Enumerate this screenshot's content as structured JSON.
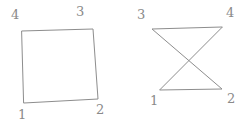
{
  "canvas": {
    "width": 248,
    "height": 126,
    "background": "#ffffff",
    "stroke_color": "#8d8d8d",
    "label_color": "#8a8a8a",
    "stroke_width": 1
  },
  "figures": [
    {
      "id": "simple-quadrilateral",
      "name": "left-figure",
      "kind": "simple convex quadrilateral",
      "vertices": [
        {
          "label": "1",
          "x": 24,
          "y": 103,
          "label_x": 18,
          "label_y": 108
        },
        {
          "label": "2",
          "x": 98,
          "y": 99,
          "label_x": 96,
          "label_y": 103
        },
        {
          "label": "3",
          "x": 93,
          "y": 29,
          "label_x": 76,
          "label_y": 5
        },
        {
          "label": "4",
          "x": 22,
          "y": 31,
          "label_x": 11,
          "label_y": 8
        }
      ],
      "edges": [
        {
          "from": "1",
          "to": "2"
        },
        {
          "from": "2",
          "to": "3"
        },
        {
          "from": "3",
          "to": "4"
        },
        {
          "from": "4",
          "to": "1"
        }
      ],
      "path": "M 24,103 L 98,99 L 93,29 L 22,31 Z"
    },
    {
      "id": "crossed-quadrilateral",
      "name": "right-figure",
      "kind": "self-intersecting bowtie quadrilateral",
      "vertices": [
        {
          "label": "1",
          "x": 160,
          "y": 90,
          "label_x": 150,
          "label_y": 94
        },
        {
          "label": "2",
          "x": 222,
          "y": 89,
          "label_x": 227,
          "label_y": 92
        },
        {
          "label": "3",
          "x": 152,
          "y": 29,
          "label_x": 137,
          "label_y": 8
        },
        {
          "label": "4",
          "x": 222,
          "y": 27,
          "label_x": 226,
          "label_y": 6
        }
      ],
      "edges": [
        {
          "from": "1",
          "to": "2"
        },
        {
          "from": "2",
          "to": "3"
        },
        {
          "from": "3",
          "to": "4"
        },
        {
          "from": "4",
          "to": "1"
        }
      ],
      "crossing_point": {
        "x": 190,
        "y": 60
      },
      "path": "M 160,90 L 222,89 L 152,29 L 222,27 Z"
    }
  ]
}
